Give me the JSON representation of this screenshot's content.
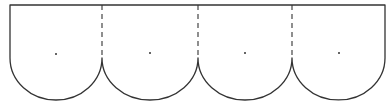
{
  "diagram": {
    "title": "",
    "colors": {
      "stroke": "#333333",
      "background": "#ffffff"
    },
    "geometry": {
      "top_y": 5,
      "left_x": 10,
      "right_x": 385,
      "cusp_y": 58,
      "bottom_y": 100
    },
    "fold_lines": [
      {
        "x": 102,
        "style": "dashed"
      },
      {
        "x": 198,
        "style": "dashed"
      },
      {
        "x": 292,
        "style": "dashed"
      }
    ],
    "lobes": [
      {
        "index": 1,
        "x_start": 10,
        "x_end": 102,
        "center_dot": {
          "x": 56,
          "y": 54
        }
      },
      {
        "index": 2,
        "x_start": 102,
        "x_end": 198,
        "center_dot": {
          "x": 150,
          "y": 53
        }
      },
      {
        "index": 3,
        "x_start": 198,
        "x_end": 292,
        "center_dot": {
          "x": 245,
          "y": 53
        }
      },
      {
        "index": 4,
        "x_start": 292,
        "x_end": 385,
        "center_dot": {
          "x": 339,
          "y": 53
        }
      }
    ]
  }
}
